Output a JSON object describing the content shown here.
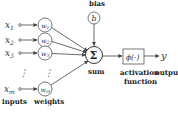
{
  "diagram": {
    "type": "perceptron",
    "inputs": [
      {
        "label": "x",
        "sub": "1"
      },
      {
        "label": "x",
        "sub": "2"
      },
      {
        "label": "x",
        "sub": "3"
      },
      {
        "label": "x",
        "sub": "m"
      }
    ],
    "weights": [
      {
        "label": "w",
        "sub": "1"
      },
      {
        "label": "w",
        "sub": "2"
      },
      {
        "label": "w",
        "sub": "3"
      },
      {
        "label": "w",
        "sub": "m"
      }
    ],
    "bias": {
      "title": "bias",
      "symbol": "b"
    },
    "sum": {
      "symbol": "Σ",
      "label": "sum"
    },
    "activation": {
      "symbol": "ϕ(·)",
      "label_line1": "activation",
      "label_line2": "function"
    },
    "output": {
      "symbol": "y",
      "label": "output"
    },
    "labels": {
      "inputs": "inputs",
      "weights": "weights"
    },
    "ellipsis": "⋮",
    "colors": {
      "stroke": "#444444",
      "text": "#222222",
      "background": "#ffffff"
    }
  }
}
